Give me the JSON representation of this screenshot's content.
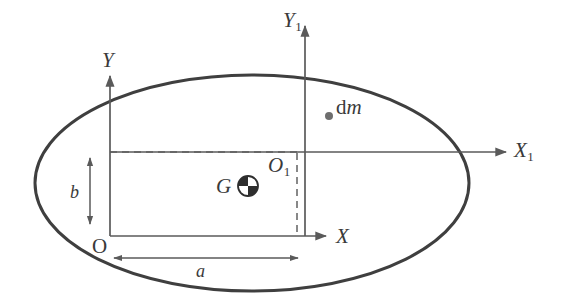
{
  "figure": {
    "type": "geometry-diagram",
    "canvas": {
      "width": 566,
      "height": 308,
      "background": "#ffffff"
    },
    "stroke_color": "#3f3f3f",
    "line_color": "#5a5a5a",
    "dash_color": "#6b6b6b"
  },
  "shape": {
    "name": "ellipse",
    "center": {
      "x": 252,
      "y": 183
    },
    "semi_axis_x": 217,
    "semi_axis_y": 108,
    "stroke_width": 3
  },
  "axes": [
    {
      "id": "Y1",
      "label": "Y",
      "subscript": "1",
      "orientation": "vertical",
      "origin": {
        "x": 305,
        "y": 152
      },
      "tip": {
        "x": 305,
        "y": 22
      }
    },
    {
      "id": "X1",
      "label": "X",
      "subscript": "1",
      "orientation": "horizontal",
      "origin": {
        "x": 110,
        "y": 152
      },
      "tip": {
        "x": 510,
        "y": 152
      }
    },
    {
      "id": "Y",
      "label": "Y",
      "subscript": "",
      "orientation": "vertical",
      "origin": {
        "x": 110,
        "y": 236
      },
      "tip": {
        "x": 110,
        "y": 72
      }
    },
    {
      "id": "X",
      "label": "X",
      "subscript": "",
      "orientation": "horizontal",
      "origin": {
        "x": 110,
        "y": 236
      },
      "tip": {
        "x": 330,
        "y": 236
      }
    }
  ],
  "points": [
    {
      "id": "O",
      "label": "O",
      "subscript": "",
      "role": "origin-of-XY-frame",
      "x": 110,
      "y": 236
    },
    {
      "id": "O1",
      "label": "O",
      "subscript": "1",
      "role": "origin-of-X1Y1-frame",
      "x": 305,
      "y": 152
    },
    {
      "id": "G",
      "label": "G",
      "subscript": "",
      "role": "center-of-mass",
      "x": 248,
      "y": 186,
      "marker": "quartered-circle",
      "marker_radius": 10
    },
    {
      "id": "dm",
      "label_upright": "d",
      "label_italic": "m",
      "role": "mass-element",
      "x": 329,
      "y": 116,
      "marker": "filled-dot",
      "marker_radius": 4
    }
  ],
  "dimensions": [
    {
      "id": "a",
      "label": "a",
      "orientation": "horizontal",
      "from": {
        "x": 112,
        "y": 258
      },
      "to": {
        "x": 300,
        "y": 258
      },
      "arrow": "double",
      "meaning": "horizontal distance from O to O1"
    },
    {
      "id": "b",
      "label": "b",
      "orientation": "vertical",
      "from": {
        "x": 90,
        "y": 155
      },
      "to": {
        "x": 90,
        "y": 226
      },
      "arrow": "double",
      "meaning": "vertical distance from O to O1"
    }
  ],
  "guides": [
    {
      "id": "horizontal-dashed",
      "style": "dashed",
      "from": {
        "x": 110,
        "y": 152
      },
      "to": {
        "x": 298,
        "y": 152
      }
    },
    {
      "id": "vertical-dashed",
      "style": "dashed",
      "from": {
        "x": 297,
        "y": 152
      },
      "to": {
        "x": 297,
        "y": 236
      }
    }
  ]
}
